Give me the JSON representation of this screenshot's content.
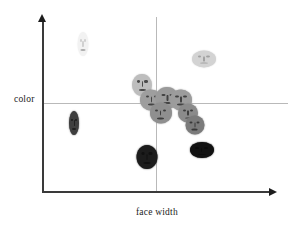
{
  "chart_data": {
    "type": "scatter",
    "title": "",
    "xlabel": "face width",
    "ylabel": "color",
    "xlim": [
      0,
      1
    ],
    "ylim": [
      0,
      1
    ],
    "grid": false,
    "legend": null,
    "annotations": [],
    "quadrant_divider_x": 0.52,
    "quadrant_divider_y": 0.52,
    "points": [
      {
        "id": "face-1",
        "x": 0.18,
        "y": 0.87,
        "width_px": 11,
        "height_px": 24,
        "shade": "#f2f2f2",
        "group": "narrow-light"
      },
      {
        "id": "face-2",
        "x": 0.71,
        "y": 0.78,
        "width_px": 24,
        "height_px": 17,
        "shade": "#d3d3d3",
        "group": "wide-light"
      },
      {
        "id": "face-3",
        "x": 0.44,
        "y": 0.63,
        "width_px": 20,
        "height_px": 22,
        "shade": "#bdbdbd",
        "group": "mid"
      },
      {
        "id": "face-4",
        "x": 0.48,
        "y": 0.54,
        "width_px": 22,
        "height_px": 21,
        "shade": "#9e9e9e",
        "group": "mid"
      },
      {
        "id": "face-5",
        "x": 0.55,
        "y": 0.55,
        "width_px": 23,
        "height_px": 22,
        "shade": "#9a9a9a",
        "group": "mid"
      },
      {
        "id": "face-6",
        "x": 0.61,
        "y": 0.54,
        "width_px": 22,
        "height_px": 21,
        "shade": "#9c9c9c",
        "group": "mid"
      },
      {
        "id": "face-7",
        "x": 0.52,
        "y": 0.46,
        "width_px": 22,
        "height_px": 21,
        "shade": "#8f8f8f",
        "group": "mid"
      },
      {
        "id": "face-8",
        "x": 0.64,
        "y": 0.46,
        "width_px": 20,
        "height_px": 19,
        "shade": "#8b8b8b",
        "group": "mid"
      },
      {
        "id": "face-9",
        "x": 0.67,
        "y": 0.39,
        "width_px": 19,
        "height_px": 19,
        "shade": "#7b7b7b",
        "group": "mid"
      },
      {
        "id": "face-10",
        "x": 0.14,
        "y": 0.4,
        "width_px": 10,
        "height_px": 24,
        "shade": "#3e3e3e",
        "group": "narrow-dark"
      },
      {
        "id": "face-11",
        "x": 0.46,
        "y": 0.2,
        "width_px": 21,
        "height_px": 24,
        "shade": "#1c1c1c",
        "group": "dark"
      },
      {
        "id": "face-12",
        "x": 0.7,
        "y": 0.24,
        "width_px": 24,
        "height_px": 16,
        "shade": "#111111",
        "group": "wide-dark"
      }
    ]
  },
  "axes": {
    "y_label": "color",
    "x_label": "face width",
    "y_arrow_icon": "arrow-up-icon",
    "x_arrow_icon": "arrow-right-icon"
  }
}
